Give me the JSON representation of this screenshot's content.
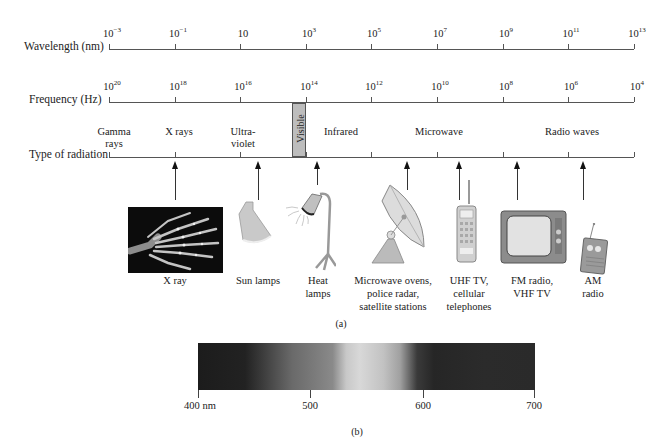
{
  "part_a": {
    "caption": "(a)",
    "wavelength_axis": {
      "label": "Wavelength (nm)",
      "ticks": [
        {
          "base": "10",
          "exp": "−3"
        },
        {
          "base": "10",
          "exp": "−1"
        },
        {
          "base": "10",
          "exp": ""
        },
        {
          "base": "10",
          "exp": "3"
        },
        {
          "base": "10",
          "exp": "5"
        },
        {
          "base": "10",
          "exp": "7"
        },
        {
          "base": "10",
          "exp": "9"
        },
        {
          "base": "10",
          "exp": "11"
        },
        {
          "base": "10",
          "exp": "13"
        }
      ]
    },
    "frequency_axis": {
      "label": "Frequency (Hz)",
      "ticks": [
        {
          "base": "10",
          "exp": "20"
        },
        {
          "base": "10",
          "exp": "18"
        },
        {
          "base": "10",
          "exp": "16"
        },
        {
          "base": "10",
          "exp": "14"
        },
        {
          "base": "10",
          "exp": "12"
        },
        {
          "base": "10",
          "exp": "10"
        },
        {
          "base": "10",
          "exp": "8"
        },
        {
          "base": "10",
          "exp": "6"
        },
        {
          "base": "10",
          "exp": "4"
        }
      ]
    },
    "radiation_axis": {
      "label": "Type of radiation",
      "types": [
        {
          "line1": "Gamma",
          "line2": "rays"
        },
        {
          "line1": "X rays",
          "line2": ""
        },
        {
          "line1": "Ultra-",
          "line2": "violet"
        },
        {
          "line1": "Visible",
          "line2": ""
        },
        {
          "line1": "Infrared",
          "line2": ""
        },
        {
          "line1": "Microwave",
          "line2": ""
        },
        {
          "line1": "Radio waves",
          "line2": ""
        }
      ]
    },
    "examples": [
      {
        "icon": "x-ray-hand-image",
        "line1": "X ray",
        "line2": "",
        "line3": ""
      },
      {
        "icon": "sun-lamp-icon",
        "line1": "Sun lamps",
        "line2": "",
        "line3": ""
      },
      {
        "icon": "heat-lamp-icon",
        "line1": "Heat",
        "line2": "lamps",
        "line3": ""
      },
      {
        "icon": "satellite-dish-icon",
        "line1": "Microwave ovens,",
        "line2": "police radar,",
        "line3": "satellite stations"
      },
      {
        "icon": "cellular-phone-icon",
        "line1": "UHF TV,",
        "line2": "cellular",
        "line3": "telephones"
      },
      {
        "icon": "television-icon",
        "line1": "FM radio,",
        "line2": "VHF TV",
        "line3": ""
      },
      {
        "icon": "am-radio-icon",
        "line1": "AM",
        "line2": "radio",
        "line3": ""
      }
    ]
  },
  "part_b": {
    "caption": "(b)",
    "spectrum_ticks": [
      "400 nm",
      "500",
      "600",
      "700"
    ]
  },
  "colors": {
    "axis": "#555555",
    "visible_band": "#bdbdbd",
    "spectrum_dark": "#1c1c1c",
    "spectrum_light": "#d8d8d8"
  }
}
